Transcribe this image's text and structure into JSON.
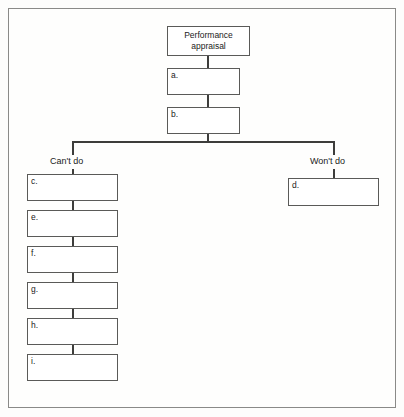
{
  "diagram": {
    "type": "flowchart",
    "title_node": {
      "id": "root",
      "line1": "Performance",
      "line2": "appraisal"
    },
    "nodes": [
      {
        "id": "a",
        "label": "a."
      },
      {
        "id": "b",
        "label": "b."
      },
      {
        "id": "c",
        "label": "c."
      },
      {
        "id": "d",
        "label": "d."
      },
      {
        "id": "e",
        "label": "e."
      },
      {
        "id": "f",
        "label": "f."
      },
      {
        "id": "g",
        "label": "g."
      },
      {
        "id": "h",
        "label": "h."
      },
      {
        "id": "i",
        "label": "i."
      }
    ],
    "branch_labels": {
      "left": "Can't do",
      "right": "Won't do"
    },
    "colors": {
      "border": "#5a5a58",
      "frame": "#8a8a88",
      "connector": "#3d3d3b",
      "background": "#fefefd",
      "text": "#1b1b1b"
    }
  }
}
